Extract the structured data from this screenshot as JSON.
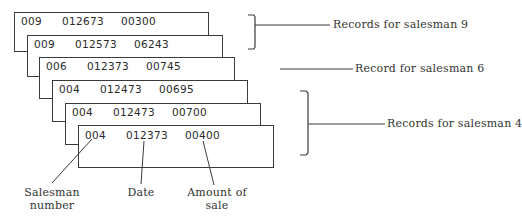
{
  "diagram": {
    "records": [
      {
        "salesman": "009",
        "date": "012673",
        "amount": "00300"
      },
      {
        "salesman": "009",
        "date": "012573",
        "amount": "06243"
      },
      {
        "salesman": "006",
        "date": "012373",
        "amount": "00745"
      },
      {
        "salesman": "004",
        "date": "012473",
        "amount": "00695"
      },
      {
        "salesman": "004",
        "date": "012473",
        "amount": "00700"
      },
      {
        "salesman": "004",
        "date": "012373",
        "amount": "00400"
      }
    ],
    "group_labels": {
      "salesman_9": "Records for salesman 9",
      "salesman_6": "Record for salesman 6",
      "salesman_4": "Records for salesman 4"
    },
    "field_labels": {
      "salesman_number_line1": "Salesman",
      "salesman_number_line2": "number",
      "date": "Date",
      "amount_line1": "Amount of",
      "amount_line2": "sale"
    },
    "colors": {
      "line": "#3a3a3a",
      "text": "#2a2a2a"
    }
  }
}
